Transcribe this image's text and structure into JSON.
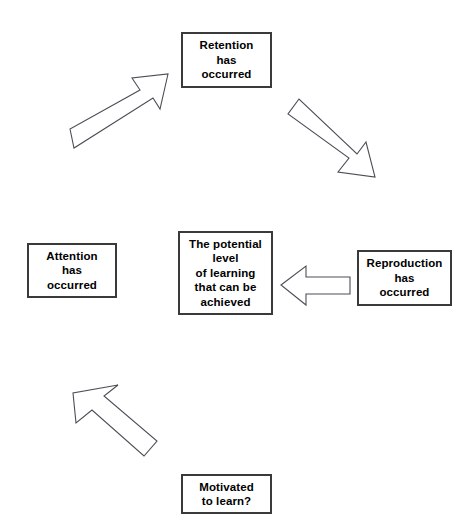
{
  "diagram": {
    "type": "cycle-flow-diagram",
    "background_color": "#ffffff",
    "box_border_color": "#3a3a3a",
    "arrow_outline_color": "#4d4d57",
    "arrow_fill_color": "#ffffff",
    "text_color": "#000000",
    "nodes": [
      {
        "id": "retention",
        "lines": [
          "Retention",
          "has",
          "occurred"
        ],
        "position": "top-center"
      },
      {
        "id": "potential",
        "lines": [
          "The potential",
          "level",
          "of learning",
          "that can be",
          "achieved"
        ],
        "position": "center"
      },
      {
        "id": "attention",
        "lines": [
          "Attention",
          "has",
          "occurred"
        ],
        "position": "middle-left"
      },
      {
        "id": "reproduction",
        "lines": [
          "Reproduction",
          "has",
          "occurred"
        ],
        "position": "middle-right"
      },
      {
        "id": "motivated",
        "lines": [
          "Motivated",
          "to learn?"
        ],
        "position": "bottom-center"
      }
    ],
    "arrows": [
      {
        "id": "attention-to-retention",
        "direction": "up-right",
        "from": "attention",
        "to": "retention"
      },
      {
        "id": "retention-to-reproduction",
        "direction": "down-right",
        "from": "retention",
        "to": "reproduction"
      },
      {
        "id": "reproduction-to-potential",
        "direction": "left",
        "from": "reproduction",
        "to": "potential"
      },
      {
        "id": "motivated-to-attention",
        "direction": "up-left",
        "from": "motivated",
        "to": "attention"
      }
    ]
  }
}
